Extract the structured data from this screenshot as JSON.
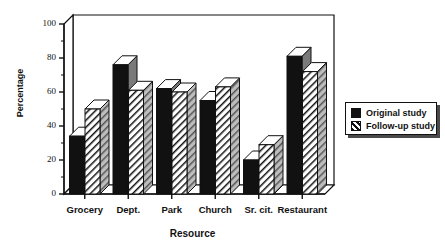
{
  "chart_data": {
    "type": "bar",
    "title": "",
    "subtitle": "",
    "xlabel": "Resource",
    "ylabel": "Percentage",
    "categories": [
      "Grocery",
      "Dept.",
      "Park",
      "Church",
      "Sr. cit.",
      "Restaurant"
    ],
    "series": [
      {
        "name": "Original study",
        "values": [
          34,
          76,
          62,
          55,
          20,
          81
        ],
        "fill": "solid-black",
        "color": "#111111"
      },
      {
        "name": "Follow-up study",
        "values": [
          50,
          61,
          60,
          63,
          29,
          72
        ],
        "fill": "diagonal-hatch",
        "color": "#111111"
      }
    ],
    "ylim": [
      0,
      100
    ],
    "ytick_values": [
      0,
      20,
      40,
      60,
      80,
      100
    ],
    "ytick_labels": [
      "0",
      "20",
      "40",
      "60",
      "80",
      "100"
    ],
    "yminor_step": 10,
    "grid": false,
    "legend_position": "right",
    "style": "3d-bars",
    "legend_entries": [
      "Original study",
      "Follow-up study"
    ]
  },
  "legend": {
    "items": [
      {
        "label": "Original study",
        "swatch": "solid-black-swatch"
      },
      {
        "label": "Follow-up study",
        "swatch": "hatched-swatch"
      }
    ]
  },
  "axes": {
    "y_title": "Percentage",
    "x_title": "Resource",
    "y_labels": [
      "100",
      "80",
      "60",
      "40",
      "20",
      "0"
    ],
    "x_labels": [
      "Grocery",
      "Dept.",
      "Park",
      "Church",
      "Sr. cit.",
      "Restaurant"
    ]
  },
  "colors": {
    "bar_front_solid": "#111111",
    "bar_side": "#7a7a7a",
    "bar_top": "#ffffff",
    "outline": "#111111",
    "background": "#ffffff",
    "shadow": "#4a4a4a"
  }
}
